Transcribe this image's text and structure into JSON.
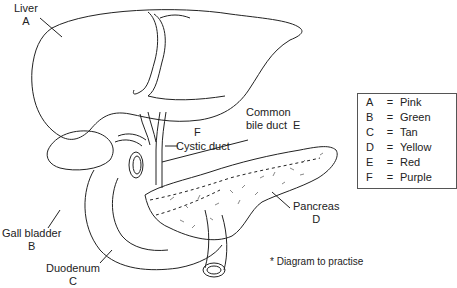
{
  "labels": {
    "liver": {
      "name": "Liver",
      "letter": "A"
    },
    "gall_bladder": {
      "name": "Gall bladder",
      "letter": "B"
    },
    "duodenum": {
      "name": "Duodenum",
      "letter": "C"
    },
    "pancreas": {
      "name": "Pancreas",
      "letter": "D"
    },
    "common_bile_duct": {
      "name_line1": "Common",
      "name_line2": "bile duct",
      "letter": "E"
    },
    "cystic_duct": {
      "name": "Cystic duct",
      "letter": "F"
    }
  },
  "key": {
    "rows": [
      {
        "letter": "A",
        "eq": "=",
        "color": "Pink"
      },
      {
        "letter": "B",
        "eq": "=",
        "color": "Green"
      },
      {
        "letter": "C",
        "eq": "=",
        "color": "Tan"
      },
      {
        "letter": "D",
        "eq": "=",
        "color": "Yellow"
      },
      {
        "letter": "E",
        "eq": "=",
        "color": "Red"
      },
      {
        "letter": "F",
        "eq": "=",
        "color": "Purple"
      }
    ]
  },
  "note": "* Diagram to practise"
}
